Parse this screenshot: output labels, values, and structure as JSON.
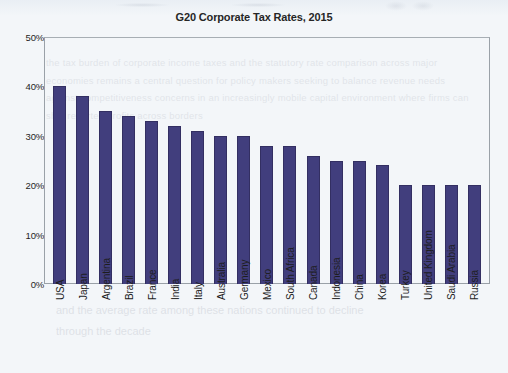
{
  "chart_data": {
    "type": "bar",
    "title": "G20 Corporate Tax Rates, 2015",
    "xlabel": "",
    "ylabel": "",
    "grid": false,
    "legend": null,
    "ylim": [
      0,
      50
    ],
    "ytick_labels": [
      "50%",
      "40%",
      "30%",
      "20%",
      "10%",
      "0%"
    ],
    "ytick_values": [
      50,
      40,
      30,
      20,
      10,
      0
    ],
    "value_unit": "%",
    "bar_color": "#413e7d",
    "categories": [
      "USA",
      "Japan",
      "Argentina",
      "Brazil",
      "France",
      "India",
      "Italy",
      "Australia",
      "Germany",
      "Mexico",
      "South Africa",
      "Canada",
      "Indonesia",
      "China",
      "Korea",
      "Turkey",
      "United Kingdom",
      "Saudi Arabia",
      "Russia"
    ],
    "values": [
      40,
      38,
      35,
      34,
      33,
      32,
      31,
      30,
      30,
      28,
      28,
      26,
      25,
      25,
      24,
      20,
      20,
      20,
      20
    ]
  },
  "artifacts": {
    "ghost_text": "the tax burden of corporate income taxes and the statutory rate comparison across major economies remains a central question for policy makers seeking to balance revenue needs against competitiveness concerns in an increasingly mobile capital environment where firms can shift reported profits across borders",
    "ghost_text_lower": "and the average rate among these nations continued to decline through the decade"
  }
}
